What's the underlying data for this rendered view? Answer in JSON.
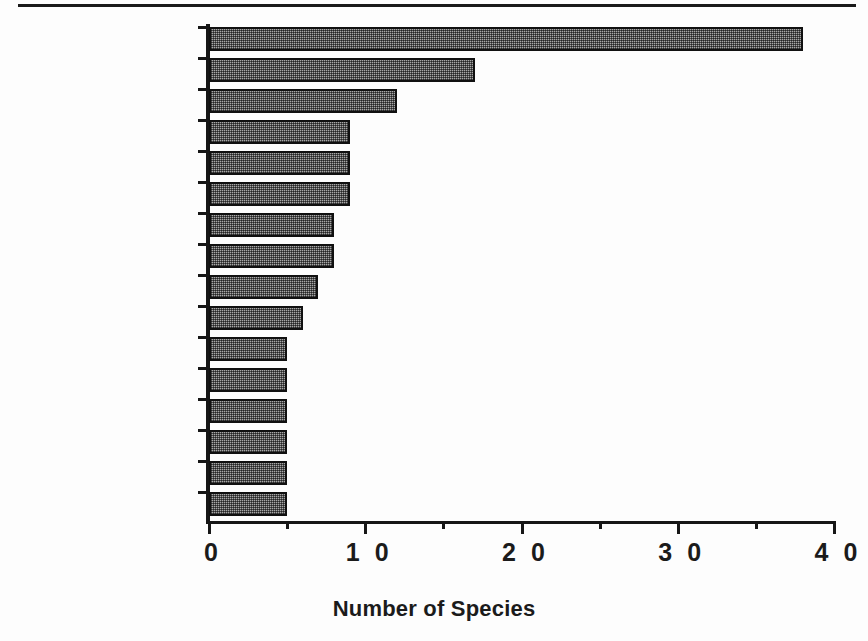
{
  "figure": {
    "has_top_rule": true,
    "background_color": "#fdfdfd",
    "ink_color": "#161616",
    "bar_fill_color": "#a8a8a8",
    "bar_border_color": "#111111"
  },
  "chart_data": {
    "type": "bar",
    "orientation": "horizontal",
    "title": "",
    "xlabel": "Number of Species",
    "ylabel": "",
    "xlim": [
      0,
      40
    ],
    "x_ticks_major": [
      0,
      10,
      20,
      30,
      40
    ],
    "x_tick_labels": [
      "0",
      "1 0",
      "2 0",
      "3 0",
      "4 0"
    ],
    "x_ticks_minor": [
      5,
      15,
      25,
      35
    ],
    "grid": false,
    "legend": null,
    "categories": [
      "FERNS",
      "GRAMINEAE",
      "ARACEAE",
      "ASCLEPIADACEAE",
      "MARANTACEAE",
      "RUBIACEAE",
      "ZINGIBERACEAE",
      "ORCHIDACEAE",
      "ACANTHACEAE",
      "PIPERACEAE",
      "PASSIFLORACEAE",
      "COMMELINACEAE",
      "CYPERACEAE",
      "DIOSCOREACEAE",
      "SMILACACEAE",
      "APOCYNACEAE"
    ],
    "values": [
      38,
      17,
      12,
      9,
      9,
      9,
      8,
      8,
      7,
      6,
      5,
      5,
      5,
      5,
      5,
      5
    ]
  }
}
